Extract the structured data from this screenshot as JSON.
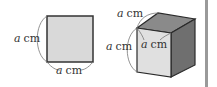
{
  "square": {
    "side_label_left": {
      "var": "a",
      "unit": "cm"
    },
    "side_label_bottom": {
      "var": "a",
      "unit": "cm"
    },
    "fill": "#d9d9d9",
    "stroke": "#333333"
  },
  "cube": {
    "label_top": {
      "var": "a",
      "unit": "cm"
    },
    "label_left": {
      "var": "a",
      "unit": "cm"
    },
    "label_inner": {
      "var": "a",
      "unit": "cm"
    },
    "front_fill": "#e0e0e0",
    "top_fill": "#8a8a8a",
    "right_fill": "#6f6f6f",
    "stroke": "#2a2a2a"
  },
  "side_bar": {
    "color": "#9a9a9a"
  }
}
